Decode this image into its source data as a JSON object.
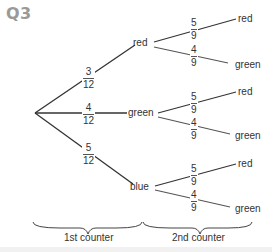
{
  "title": "Q3",
  "tree": {
    "first": [
      {
        "label": "red",
        "prob_num": "3",
        "prob_den": "12"
      },
      {
        "label": "green",
        "prob_num": "4",
        "prob_den": "12"
      },
      {
        "label": "blue",
        "prob_num": "5",
        "prob_den": "12"
      }
    ],
    "second": [
      {
        "upper": {
          "label": "red",
          "prob_num": "5",
          "prob_den": "9"
        },
        "lower": {
          "label": "green",
          "prob_num": "4",
          "prob_den": "9"
        }
      },
      {
        "upper": {
          "label": "red",
          "prob_num": "5",
          "prob_den": "9"
        },
        "lower": {
          "label": "green",
          "prob_num": "4",
          "prob_den": "9"
        }
      },
      {
        "upper": {
          "label": "red",
          "prob_num": "5",
          "prob_den": "9"
        },
        "lower": {
          "label": "green",
          "prob_num": "4",
          "prob_den": "9"
        }
      }
    ]
  },
  "braces": {
    "first": "1st counter",
    "second": "2nd counter"
  }
}
